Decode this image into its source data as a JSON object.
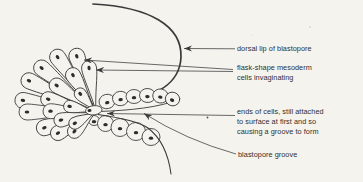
{
  "window": {
    "width_px": 363,
    "height_px": 182
  },
  "figure": {
    "paper_color": "#f5f3ee",
    "ink_color": "#3a3a3a",
    "labels": {
      "dorsal_lip": "dorsal lip of blastopore",
      "flask_cells": "flask-shape mesoderm\ncells invaginating",
      "cell_ends": "ends of cells, still attached\nto surface at first and so\ncausing a groove to form",
      "groove": "blastopore groove"
    }
  }
}
